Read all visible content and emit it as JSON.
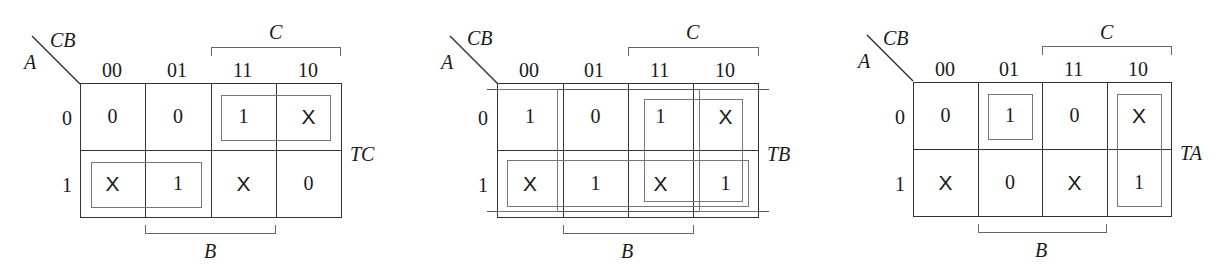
{
  "maps": [
    {
      "id": "TC",
      "output_label": "TC",
      "corner": {
        "col_vars": "CB",
        "row_vars": "A"
      },
      "col_headers": [
        "00",
        "01",
        "11",
        "10"
      ],
      "row_headers": [
        "0",
        "1"
      ],
      "cells": [
        [
          "0",
          "0",
          "1",
          "X"
        ],
        [
          "X",
          "1",
          "X",
          "0"
        ]
      ],
      "top_bracket_label": "C",
      "bottom_bracket_label": "B",
      "groups": [
        {
          "row": 0,
          "cols": [
            2,
            3
          ]
        },
        {
          "row": 1,
          "cols": [
            0,
            1
          ]
        }
      ]
    },
    {
      "id": "TB",
      "output_label": "TB",
      "corner": {
        "col_vars": "CB",
        "row_vars": "A"
      },
      "col_headers": [
        "00",
        "01",
        "11",
        "10"
      ],
      "row_headers": [
        "0",
        "1"
      ],
      "cells": [
        [
          "1",
          "0",
          "1",
          "X"
        ],
        [
          "X",
          "1",
          "X",
          "1"
        ]
      ],
      "top_bracket_label": "C",
      "bottom_bracket_label": "B",
      "groups": [
        {
          "rows": [
            0,
            1
          ],
          "cols": [
            0,
            3
          ],
          "wrap": true
        },
        {
          "rows": [
            0,
            1
          ],
          "cols": [
            2,
            3
          ]
        },
        {
          "row": 1,
          "cols": [
            0,
            1,
            2,
            3
          ]
        }
      ]
    },
    {
      "id": "TA",
      "output_label": "TA",
      "corner": {
        "col_vars": "CB",
        "row_vars": "A"
      },
      "col_headers": [
        "00",
        "01",
        "11",
        "10"
      ],
      "row_headers": [
        "0",
        "1"
      ],
      "cells": [
        [
          "0",
          "1",
          "0",
          "X"
        ],
        [
          "X",
          "0",
          "X",
          "1"
        ]
      ],
      "top_bracket_label": "C",
      "bottom_bracket_label": "B",
      "groups": [
        {
          "row": 0,
          "cols": [
            1
          ]
        },
        {
          "rows": [
            0,
            1
          ],
          "cols": [
            3
          ]
        }
      ]
    }
  ]
}
